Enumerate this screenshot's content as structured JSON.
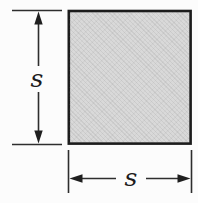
{
  "figure": {
    "background_color": "#fcfcfc",
    "square": {
      "fill_color": "#d9d9d9",
      "border_color": "#1c1c1c"
    },
    "line_color": "#2e2e2e",
    "dimensions": {
      "vertical_label": "s",
      "horizontal_label": "s"
    }
  }
}
